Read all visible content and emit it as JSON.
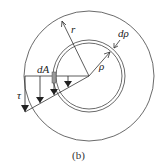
{
  "diagram": {
    "labels": {
      "outer_radius": "r",
      "ring_thickness": "dρ",
      "ring_radius": "ρ",
      "area_element": "dA",
      "shear_stress": "τ"
    },
    "caption": "(b)",
    "stroke_color": "#333333",
    "area_fill": "#999999"
  }
}
